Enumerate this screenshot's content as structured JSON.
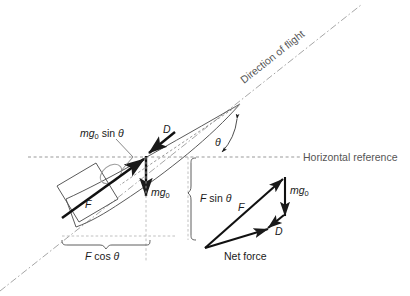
{
  "figure": {
    "title_semantic": "aircraft-climb-force-diagram",
    "background_color": "#ffffff",
    "line_color": "#1a1a1a",
    "guide_color": "#999999",
    "body_color": "#4d4d4d"
  },
  "labels": {
    "direction_of_flight": "Direction of flight",
    "horizontal_reference": "Horizontal reference",
    "mg_sin_theta": "mg",
    "mg_sin_theta_sub": "0",
    "mg_sin_theta_rest": " sin ",
    "theta_glyph": "θ",
    "drag": "D",
    "weight": "mg",
    "weight_sub": "0",
    "thrust": "F",
    "f_sin_theta_pre": "F",
    "f_sin_theta_rest": " sin ",
    "f_cos_theta_pre": "F",
    "f_cos_theta_rest": " cos ",
    "angle_theta": "θ",
    "net_force": "Net force",
    "net_thrust": "F",
    "net_weight": "mg",
    "net_weight_sub": "0",
    "net_drag": "D"
  },
  "geometry": {
    "flight_path_angle_deg": 38,
    "horizontal_reference_y": 157,
    "flight_line_start": [
      0,
      291
    ],
    "flight_line_end": [
      361,
      5
    ],
    "cg_point": [
      146,
      157
    ],
    "nose_point": [
      240,
      104
    ],
    "tail_point": [
      62,
      218
    ],
    "f_cos_theta_span": [
      62,
      154
    ],
    "f_sin_theta_span": [
      158,
      240
    ],
    "net_force_origin": [
      205,
      248
    ],
    "net_force_apex": [
      285,
      177
    ],
    "net_force_drag_end": [
      272,
      225
    ]
  },
  "icons": {
    "arrowhead": "arrowhead-icon",
    "angle_arc": "angle-arc-icon",
    "brace_horizontal": "brace-horizontal-icon",
    "brace_vertical": "brace-vertical-icon"
  }
}
